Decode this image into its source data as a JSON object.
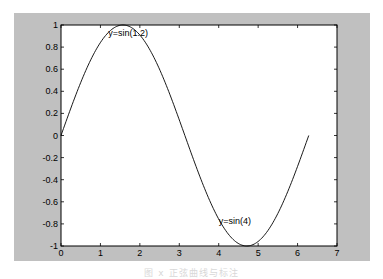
{
  "figure": {
    "frame_color": "#c0c0c0",
    "axes_background": "#ffffff",
    "line_color": "#000000",
    "caption": "图 x  正弦曲线与标注"
  },
  "chart_data": {
    "type": "line",
    "title": "",
    "xlabel": "",
    "ylabel": "",
    "xlim": [
      0,
      7
    ],
    "ylim": [
      -1,
      1
    ],
    "grid": false,
    "legend": null,
    "x_ticks": [
      0,
      1,
      2,
      3,
      4,
      5,
      6,
      7
    ],
    "x_tick_labels": [
      "0",
      "1",
      "2",
      "3",
      "4",
      "5",
      "6",
      "7"
    ],
    "y_ticks": [
      1,
      0.8,
      0.6,
      0.4,
      0.2,
      0,
      -0.2,
      -0.4,
      -0.6,
      -0.8,
      -1
    ],
    "y_tick_labels": [
      "1",
      "0.8",
      "0.6",
      "0.4",
      "0.2",
      "0",
      "-0.2",
      "-0.4",
      "-0.6",
      "-0.8",
      "-1"
    ],
    "series": [
      {
        "name": "y=sin(x)",
        "function": "sin(x)",
        "x_range": [
          0,
          6.2832
        ],
        "x": [
          0,
          0.5,
          1.0,
          1.5708,
          2.0,
          2.5,
          3.0,
          3.1416,
          3.5,
          4.0,
          4.5,
          4.7124,
          5.0,
          5.5,
          6.0,
          6.2832
        ],
        "values": [
          0,
          0.479,
          0.841,
          1.0,
          0.909,
          0.598,
          0.141,
          0,
          -0.351,
          -0.757,
          -0.978,
          -1.0,
          -0.959,
          -0.706,
          -0.279,
          0
        ]
      }
    ],
    "annotations": [
      {
        "text": "y=sin(1.2)",
        "x": 1.2,
        "y": 0.93
      },
      {
        "text": "y=sin(4)",
        "x": 4.0,
        "y": -0.77
      }
    ]
  }
}
